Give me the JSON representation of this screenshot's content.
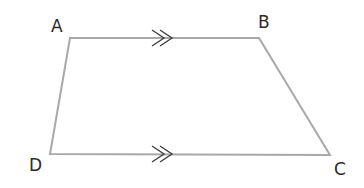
{
  "diagram": {
    "type": "trapezium",
    "vertices": [
      {
        "name": "A",
        "x": 70,
        "y": 38,
        "label_x": 51,
        "label_y": 32
      },
      {
        "name": "B",
        "x": 259,
        "y": 38,
        "label_x": 258,
        "label_y": 28
      },
      {
        "name": "C",
        "x": 330,
        "y": 155,
        "label_x": 334,
        "label_y": 175
      },
      {
        "name": "D",
        "x": 50,
        "y": 154,
        "label_x": 29,
        "label_y": 171
      }
    ],
    "parallel_marks": [
      {
        "side": "AB",
        "symbol": "double-arrow"
      },
      {
        "side": "DC",
        "symbol": "double-arrow"
      }
    ],
    "colors": {
      "edge": "#a8a8a8",
      "mark": "#3a3a3a",
      "label": "#2a2a2a"
    }
  }
}
